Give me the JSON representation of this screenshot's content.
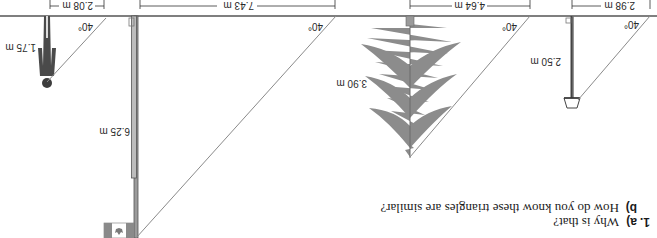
{
  "orientation": "rotated-180",
  "question": {
    "number": "1.",
    "part_a_label": "a)",
    "part_a_text": "Why is that?",
    "part_b_label": "b)",
    "part_b_text": "How do you know these triangles are similar?"
  },
  "colors": {
    "ground": "#555555",
    "hypotenuse": "#8a8a8a",
    "tree": "#8c8c8c",
    "pole": "#6e6e6e",
    "person": "#4a4a4a",
    "text": "#2a2a2a"
  },
  "objects": [
    {
      "name": "person",
      "height": "1.75 m",
      "shadow": "2.08 m",
      "angle": "40°"
    },
    {
      "name": "flagpole",
      "height": "6.25 m",
      "shadow": "7.43 m",
      "angle": "40°"
    },
    {
      "name": "tree",
      "height": "3.90 m",
      "shadow": "4.64 m",
      "angle": "40°"
    },
    {
      "name": "lamppost",
      "height": "2.50 m",
      "shadow": "2.98 m",
      "angle": "40°"
    }
  ]
}
